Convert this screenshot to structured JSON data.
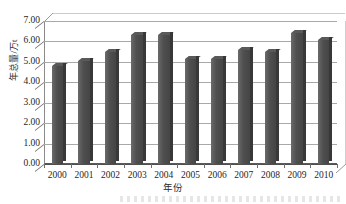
{
  "chart_data": {
    "type": "bar",
    "title": "",
    "xlabel": "年份",
    "ylabel": "年总量/万t",
    "categories": [
      "2000",
      "2001",
      "2002",
      "2003",
      "2004",
      "2005",
      "2006",
      "2007",
      "2008",
      "2009",
      "2010"
    ],
    "values": [
      4.8,
      5.05,
      5.5,
      6.3,
      6.3,
      5.15,
      5.15,
      5.6,
      5.5,
      6.4,
      6.05
    ],
    "ylim": [
      0.0,
      7.0
    ],
    "ytick_labels": [
      "0.00",
      "1.00",
      "2.00",
      "3.00",
      "4.00",
      "5.00",
      "6.00",
      "7.00"
    ],
    "ytick_values": [
      0,
      1,
      2,
      3,
      4,
      5,
      6,
      7
    ],
    "grid": true,
    "legend": false,
    "legend_position": "none",
    "series": [
      {
        "name": "年总量",
        "color": "#4a4a4a",
        "values": [
          4.8,
          5.05,
          5.5,
          6.3,
          6.3,
          5.15,
          5.15,
          5.6,
          5.5,
          6.4,
          6.05
        ]
      }
    ],
    "style": "3d-column",
    "bar_color": "#4a4a4a",
    "gridline_color": "#a9a9a9",
    "axis_color": "#5a5a5a"
  }
}
